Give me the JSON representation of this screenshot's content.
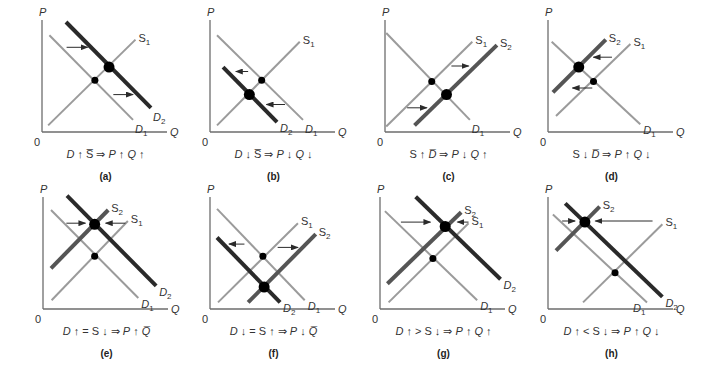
{
  "figure": {
    "axis_labels": {
      "y": "P",
      "x": "Q",
      "origin": "0"
    },
    "panels": [
      {
        "id": "a",
        "tag": "(a)",
        "caption": "D↑ S̅ ⇒ P↑ Q↑",
        "caption_parts": [
          "D",
          "↑",
          "S̅",
          "⇒",
          "P",
          "↑",
          "Q",
          "↑"
        ],
        "curves": [
          {
            "name": "D1",
            "kind": "demand",
            "style": "light",
            "from": [
              6,
              88
            ],
            "to": [
              74,
              11
            ],
            "label": "D",
            "sub": "1",
            "label_at": "end-below"
          },
          {
            "name": "S1",
            "kind": "supply",
            "style": "light",
            "from": [
              5,
              6
            ],
            "to": [
              76,
              84
            ],
            "label": "S",
            "sub": "1",
            "label_at": "end-right"
          },
          {
            "name": "D2",
            "kind": "demand",
            "style": "dark",
            "from": [
              19.5,
              100
            ],
            "to": [
              88.6,
              22
            ],
            "label": "D",
            "sub": "2",
            "label_at": "end-below"
          }
        ],
        "equilibria": [
          {
            "type": "initial",
            "q": 43,
            "p": 47
          },
          {
            "type": "new",
            "q": 54.5,
            "p": 59
          }
        ],
        "shift_arrows": [
          {
            "p": 77,
            "q_from": 20,
            "q_to": 37
          },
          {
            "p": 34,
            "q_from": 58,
            "q_to": 74
          }
        ]
      },
      {
        "id": "b",
        "tag": "(b)",
        "caption_parts": [
          "D",
          "↓",
          "S̅",
          "⇒",
          "P",
          "↓",
          "Q",
          "↓"
        ],
        "curves": [
          {
            "name": "D1",
            "kind": "demand",
            "style": "light",
            "from": [
              5.7,
              88
            ],
            "to": [
              75.6,
              11
            ],
            "label": "D",
            "sub": "1",
            "label_at": "end-below"
          },
          {
            "name": "S1",
            "kind": "supply",
            "style": "light",
            "from": [
              5.7,
              6
            ],
            "to": [
              73,
              82
            ],
            "label": "S",
            "sub": "1",
            "label_at": "end-right"
          },
          {
            "name": "D2",
            "kind": "demand",
            "style": "dark",
            "from": [
              10.6,
              59
            ],
            "to": [
              54.5,
              9
            ],
            "label": "D",
            "sub": "2",
            "label_at": "end-right-low"
          }
        ],
        "equilibria": [
          {
            "type": "initial",
            "q": 42,
            "p": 47
          },
          {
            "type": "new",
            "q": 32,
            "p": 34
          }
        ],
        "shift_arrows": [
          {
            "p": 55,
            "q_from": 31,
            "q_to": 21
          },
          {
            "p": 25,
            "q_from": 61,
            "q_to": 46
          }
        ]
      },
      {
        "id": "c",
        "tag": "(c)",
        "caption_parts": [
          "S",
          "↑",
          "D̅",
          "⇒",
          "P",
          "↓",
          "Q",
          "↑"
        ],
        "curves": [
          {
            "name": "D1",
            "kind": "demand",
            "style": "light",
            "from": [
              1,
              90
            ],
            "to": [
              69,
              11
            ],
            "label": "D",
            "sub": "1",
            "label_at": "end-below"
          },
          {
            "name": "S1",
            "kind": "supply",
            "style": "light",
            "from": [
              1,
              5
            ],
            "to": [
              71,
              82
            ],
            "label": "S",
            "sub": "1",
            "label_at": "end-right"
          },
          {
            "name": "S2",
            "kind": "supply",
            "style": "mid",
            "from": [
              24,
              6
            ],
            "to": [
              91,
              79
            ],
            "label": "S",
            "sub": "2",
            "label_at": "end-right"
          }
        ],
        "equilibria": [
          {
            "type": "initial",
            "q": 38,
            "p": 46
          },
          {
            "type": "new",
            "q": 50,
            "p": 34
          }
        ],
        "shift_arrows": [
          {
            "p": 60,
            "q_from": 54,
            "q_to": 68
          },
          {
            "p": 22,
            "q_from": 18,
            "q_to": 34
          }
        ]
      },
      {
        "id": "d",
        "tag": "(d)",
        "caption_parts": [
          "S",
          "↓",
          "D̅",
          "⇒",
          "P",
          "↑",
          "Q",
          "↓"
        ],
        "curves": [
          {
            "name": "D1",
            "kind": "demand",
            "style": "light",
            "from": [
              3,
              82
            ],
            "to": [
              75,
              7
            ],
            "label": "D",
            "sub": "1",
            "label_at": "end-right-low"
          },
          {
            "name": "S1",
            "kind": "supply",
            "style": "light",
            "from": [
              6.5,
              14.5
            ],
            "to": [
              67,
              80
            ],
            "label": "S",
            "sub": "1",
            "label_at": "end-right"
          },
          {
            "name": "S2",
            "kind": "supply",
            "style": "mid",
            "from": [
              4,
              36
            ],
            "to": [
              47,
              84
            ],
            "label": "S",
            "sub": "2",
            "label_at": "end-right"
          }
        ],
        "equilibria": [
          {
            "type": "initial",
            "q": 37,
            "p": 46
          },
          {
            "type": "new",
            "q": 25,
            "p": 59
          }
        ],
        "shift_arrows": [
          {
            "p": 68,
            "q_from": 52,
            "q_to": 37
          },
          {
            "p": 40,
            "q_from": 36,
            "q_to": 20
          }
        ]
      },
      {
        "id": "e",
        "tag": "(e)",
        "caption_parts": [
          "D",
          "↑",
          "=",
          "S",
          "↓",
          "⇒",
          "P",
          "↑",
          "Q̅"
        ],
        "curves": [
          {
            "name": "D1",
            "kind": "demand",
            "style": "light",
            "from": [
              6.5,
              90
            ],
            "to": [
              77.5,
              10
            ],
            "label": "D",
            "sub": "1",
            "label_at": "end-right-low"
          },
          {
            "name": "S1",
            "kind": "supply",
            "style": "light",
            "from": [
              7,
              8
            ],
            "to": [
              69,
              80
            ],
            "label": "S",
            "sub": "1",
            "label_at": "end-right"
          },
          {
            "name": "S2",
            "kind": "supply",
            "style": "mid",
            "from": [
              6.5,
              37
            ],
            "to": [
              53,
              90
            ],
            "label": "S",
            "sub": "2",
            "label_at": "end-right"
          },
          {
            "name": "D2",
            "kind": "demand",
            "style": "dark",
            "from": [
              19.5,
              103
            ],
            "to": [
              92,
              21
            ],
            "label": "D",
            "sub": "2",
            "label_at": "end-right-low"
          }
        ],
        "equilibria": [
          {
            "type": "initial",
            "q": 42,
            "p": 48
          },
          {
            "type": "new",
            "q": 42,
            "p": 77
          }
        ],
        "shift_arrows": [
          {
            "p": 78,
            "q_from": 19,
            "q_to": 34.5
          },
          {
            "p": 78,
            "q_from": 67,
            "q_to": 51
          }
        ]
      },
      {
        "id": "f",
        "tag": "(f)",
        "caption_parts": [
          "D",
          "↓",
          "=",
          "S",
          "↑",
          "⇒",
          "P",
          "↓",
          "Q̅"
        ],
        "curves": [
          {
            "name": "D1",
            "kind": "demand",
            "style": "light",
            "from": [
              5.7,
              91
            ],
            "to": [
              77,
              8
            ],
            "label": "D",
            "sub": "1",
            "label_at": "end-right-low"
          },
          {
            "name": "S1",
            "kind": "supply",
            "style": "light",
            "from": [
              6.5,
              6
            ],
            "to": [
              71.5,
              78
            ],
            "label": "S",
            "sub": "1",
            "label_at": "end-right"
          },
          {
            "name": "D2",
            "kind": "demand",
            "style": "dark",
            "from": [
              5.7,
              65
            ],
            "to": [
              57,
              6
            ],
            "label": "D",
            "sub": "2",
            "label_at": "end-right-low"
          },
          {
            "name": "S2",
            "kind": "supply",
            "style": "mid",
            "from": [
              31,
              6
            ],
            "to": [
              86,
              68
            ],
            "label": "S",
            "sub": "2",
            "label_at": "end-right"
          }
        ],
        "equilibria": [
          {
            "type": "initial",
            "q": 43,
            "p": 48
          },
          {
            "type": "new",
            "q": 44,
            "p": 20
          }
        ],
        "shift_arrows": [
          {
            "p": 59,
            "q_from": 28,
            "q_to": 15.5
          },
          {
            "p": 56,
            "q_from": 55,
            "q_to": 71.5
          }
        ]
      },
      {
        "id": "g",
        "tag": "(g)",
        "caption_parts": [
          "D",
          "↑",
          ">",
          "S",
          "↓",
          "⇒",
          "P",
          "↑",
          "Q",
          "↑"
        ],
        "curves": [
          {
            "name": "D1",
            "kind": "demand",
            "style": "light",
            "from": [
              4,
              89
            ],
            "to": [
              79,
              8
            ],
            "label": "D",
            "sub": "1",
            "label_at": "end-right-low"
          },
          {
            "name": "S1",
            "kind": "supply",
            "style": "light",
            "from": [
              7,
              6
            ],
            "to": [
              72,
              78
            ],
            "label": "S",
            "sub": "1",
            "label_at": "end-right"
          },
          {
            "name": "S2",
            "kind": "supply",
            "style": "mid",
            "from": [
              6,
              23
            ],
            "to": [
              66,
              88
            ],
            "label": "S",
            "sub": "2",
            "label_at": "end-right"
          },
          {
            "name": "D2",
            "kind": "demand",
            "style": "dark",
            "from": [
              29,
              102
            ],
            "to": [
              98,
              27
            ],
            "label": "D",
            "sub": "2",
            "label_at": "end-right-low"
          }
        ],
        "equilibria": [
          {
            "type": "initial",
            "q": 43,
            "p": 46
          },
          {
            "type": "new",
            "q": 53,
            "p": 75
          }
        ],
        "shift_arrows": [
          {
            "p": 79,
            "q_from": 17,
            "q_to": 41
          },
          {
            "p": 79,
            "q_from": 72,
            "q_to": 63
          }
        ]
      },
      {
        "id": "h",
        "tag": "(h)",
        "caption_parts": [
          "D",
          "↑",
          "<",
          "S",
          "↓",
          "⇒",
          "P",
          "↑",
          "Q",
          "↓"
        ],
        "curves": [
          {
            "name": "D1",
            "kind": "demand",
            "style": "light",
            "from": [
              4,
              86
            ],
            "to": [
              80.5,
              6
            ],
            "label": "D",
            "sub": "1",
            "label_at": "end-left-low"
          },
          {
            "name": "S1",
            "kind": "supply",
            "style": "light",
            "from": [
              28.5,
              6
            ],
            "to": [
              93,
              77
            ],
            "label": "S",
            "sub": "1",
            "label_at": "end-right"
          },
          {
            "name": "S2",
            "kind": "supply",
            "style": "mid",
            "from": [
              6.5,
              53
            ],
            "to": [
              42,
              93
            ],
            "label": "S",
            "sub": "2",
            "label_at": "end-right"
          },
          {
            "name": "D2",
            "kind": "demand",
            "style": "dark",
            "from": [
              14,
              96
            ],
            "to": [
              93,
              11
            ],
            "label": "D",
            "sub": "2",
            "label_at": "end-right-low"
          }
        ],
        "equilibria": [
          {
            "type": "initial",
            "q": 54.5,
            "p": 33
          },
          {
            "type": "new",
            "q": 30,
            "p": 79
          }
        ],
        "shift_arrows": [
          {
            "p": 80,
            "q_from": 11.5,
            "q_to": 22
          },
          {
            "p": 80,
            "q_from": 85,
            "q_to": 38.5
          }
        ]
      }
    ]
  }
}
